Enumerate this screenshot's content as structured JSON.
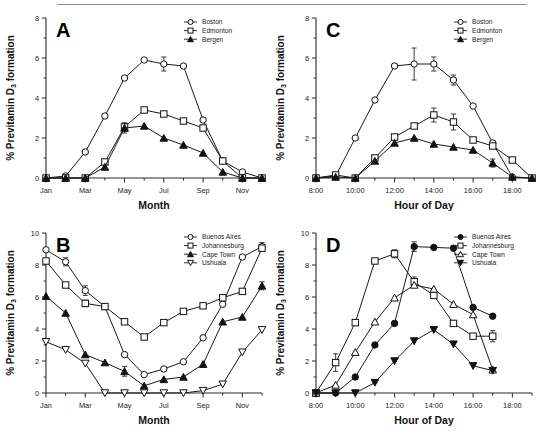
{
  "figure": {
    "ylabel_main": "% Previtamin D",
    "ylabel_subscript": "3",
    "ylabel_tail": " formation",
    "month_axis_title": "Month",
    "hour_axis_title": "Hour of Day"
  },
  "panels": {
    "a": {
      "letter": "A",
      "xlabel": "Month",
      "ylabel": "% Previtamin D3 formation",
      "legend": [
        {
          "label": "Boston",
          "marker": "open-circle"
        },
        {
          "label": "Edmonton",
          "marker": "open-square"
        },
        {
          "label": "Bergen",
          "marker": "filled-triangle"
        }
      ],
      "xticks": [
        "Jan",
        "Mar",
        "May",
        "Jul",
        "Sep",
        "Nov"
      ],
      "yticks": [
        "0",
        "2",
        "4",
        "6",
        "8"
      ]
    },
    "b": {
      "letter": "B",
      "xlabel": "Month",
      "ylabel": "% Previtamin D3 formation",
      "legend": [
        {
          "label": "Buenos Aires",
          "marker": "open-circle"
        },
        {
          "label": "Johannesburg",
          "marker": "open-square"
        },
        {
          "label": "Cape Town",
          "marker": "filled-triangle"
        },
        {
          "label": "Ushuaia",
          "marker": "open-inv-triangle"
        }
      ],
      "xticks": [
        "Jan",
        "Mar",
        "May",
        "Jul",
        "Sep",
        "Nov"
      ],
      "yticks": [
        "0",
        "2",
        "4",
        "6",
        "8",
        "10"
      ]
    },
    "c": {
      "letter": "C",
      "xlabel": "Hour of Day",
      "ylabel": "% Previtamin D3 formation",
      "legend": [
        {
          "label": "Boston",
          "marker": "open-circle"
        },
        {
          "label": "Edmonton",
          "marker": "open-square"
        },
        {
          "label": "Bergen",
          "marker": "filled-triangle"
        }
      ],
      "xticks": [
        "8:00",
        "10:00",
        "12:00",
        "14:00",
        "16:00",
        "18:00"
      ],
      "yticks": [
        "0",
        "2",
        "4",
        "6",
        "8"
      ]
    },
    "d": {
      "letter": "D",
      "xlabel": "Hour of Day",
      "ylabel": "% Previtamin D3 formation",
      "legend": [
        {
          "label": "Buenos Aires",
          "marker": "filled-circle"
        },
        {
          "label": "Johannesburg",
          "marker": "open-square"
        },
        {
          "label": "Cape Town",
          "marker": "open-triangle"
        },
        {
          "label": "Ushuaia",
          "marker": "filled-inv-triangle"
        }
      ],
      "xticks": [
        "8:00",
        "10:00",
        "12:00",
        "14:00",
        "16:00",
        "18:00"
      ],
      "yticks": [
        "0",
        "2",
        "4",
        "6",
        "8",
        "10"
      ]
    }
  },
  "chart_data": [
    {
      "type": "line",
      "panel": "A",
      "title": "A",
      "xlabel": "Month",
      "ylabel": "% Previtamin D3 formation",
      "xlim": [
        1,
        12
      ],
      "ylim": [
        0,
        8
      ],
      "grid": false,
      "legend_position": "top-right",
      "x": [
        1,
        2,
        3,
        4,
        5,
        6,
        7,
        8,
        9,
        10,
        11,
        12
      ],
      "xtick_labels": [
        "Jan",
        "Mar",
        "May",
        "Jul",
        "Sep",
        "Nov"
      ],
      "xtick_positions": [
        1,
        3,
        5,
        7,
        9,
        11
      ],
      "series": [
        {
          "name": "Boston",
          "marker": "open-circle",
          "values": [
            0.0,
            0.1,
            1.3,
            3.1,
            5.0,
            5.9,
            5.7,
            5.6,
            2.9,
            0.85,
            0.3,
            0.0
          ],
          "errors": [
            0,
            0,
            0,
            0,
            0,
            0,
            0.35,
            0,
            0,
            0,
            0,
            0
          ]
        },
        {
          "name": "Edmonton",
          "marker": "open-square",
          "values": [
            0.0,
            0.0,
            0.0,
            0.8,
            2.55,
            3.4,
            3.2,
            2.85,
            2.5,
            0.85,
            0.0,
            0.0
          ],
          "errors": [
            0,
            0,
            0,
            0,
            0.2,
            0,
            0,
            0,
            0,
            0,
            0,
            0
          ]
        },
        {
          "name": "Bergen",
          "marker": "filled-triangle",
          "values": [
            0.0,
            0.0,
            0.0,
            0.55,
            2.5,
            2.6,
            2.0,
            1.65,
            1.25,
            0.3,
            0.0,
            0.0
          ],
          "errors": [
            0,
            0,
            0,
            0,
            0.25,
            0,
            0,
            0,
            0,
            0,
            0,
            0
          ]
        }
      ]
    },
    {
      "type": "line",
      "panel": "B",
      "title": "B",
      "xlabel": "Month",
      "ylabel": "% Previtamin D3 formation",
      "xlim": [
        1,
        12
      ],
      "ylim": [
        0,
        10
      ],
      "grid": false,
      "legend_position": "top-right",
      "x": [
        1,
        2,
        3,
        4,
        5,
        6,
        7,
        8,
        9,
        10,
        11,
        12
      ],
      "xtick_labels": [
        "Jan",
        "Mar",
        "May",
        "Jul",
        "Sep",
        "Nov"
      ],
      "xtick_positions": [
        1,
        3,
        5,
        7,
        9,
        11
      ],
      "series": [
        {
          "name": "Buenos Aires",
          "marker": "open-circle",
          "values": [
            8.95,
            8.2,
            6.4,
            5.4,
            2.4,
            1.15,
            1.5,
            1.95,
            3.45,
            5.55,
            8.5,
            9.15
          ],
          "errors": [
            0,
            0.25,
            0.3,
            0,
            0,
            0,
            0,
            0,
            0,
            0,
            0,
            0.25
          ]
        },
        {
          "name": "Johannesburg",
          "marker": "open-square",
          "values": [
            8.25,
            6.75,
            5.6,
            5.4,
            4.45,
            3.5,
            4.4,
            5.1,
            5.45,
            5.95,
            6.35,
            9.05
          ],
          "errors": [
            0,
            0,
            0.2,
            0,
            0,
            0,
            0,
            0,
            0,
            0,
            0,
            0
          ]
        },
        {
          "name": "Cape Town",
          "marker": "filled-triangle",
          "values": [
            6.05,
            5.0,
            2.4,
            1.9,
            1.35,
            0.45,
            0.85,
            1.0,
            1.8,
            4.45,
            4.75,
            6.7
          ],
          "errors": [
            0,
            0,
            0,
            0,
            0.3,
            0,
            0,
            0,
            0,
            0,
            0,
            0.25
          ]
        },
        {
          "name": "Ushuaia",
          "marker": "open-inv-triangle",
          "values": [
            3.2,
            2.7,
            1.85,
            0.0,
            0.0,
            0.0,
            0.0,
            0.0,
            0.15,
            0.55,
            2.55,
            3.95
          ],
          "errors": [
            0,
            0,
            0,
            0,
            0,
            0,
            0,
            0,
            0,
            0,
            0,
            0
          ]
        }
      ]
    },
    {
      "type": "line",
      "panel": "C",
      "title": "C",
      "xlabel": "Hour of Day",
      "ylabel": "% Previtamin D3 formation",
      "xlim": [
        8,
        19
      ],
      "ylim": [
        0,
        8
      ],
      "grid": false,
      "legend_position": "top-right",
      "x": [
        8,
        9,
        10,
        11,
        12,
        13,
        14,
        15,
        16,
        17,
        18,
        19
      ],
      "xtick_labels": [
        "8:00",
        "10:00",
        "12:00",
        "14:00",
        "16:00",
        "18:00"
      ],
      "xtick_positions": [
        8,
        10,
        12,
        14,
        16,
        18
      ],
      "series": [
        {
          "name": "Boston",
          "marker": "open-circle",
          "values": [
            0.0,
            0.1,
            2.0,
            3.9,
            5.6,
            5.7,
            5.7,
            4.9,
            3.6,
            1.75,
            0.05,
            0.0
          ],
          "errors": [
            0,
            0,
            0,
            0,
            0,
            0.8,
            0.35,
            0.25,
            0,
            0,
            0,
            0
          ]
        },
        {
          "name": "Edmonton",
          "marker": "open-square",
          "values": [
            0.0,
            0.15,
            0.0,
            1.0,
            2.05,
            2.6,
            3.15,
            2.8,
            1.9,
            1.6,
            0.9,
            0.0
          ],
          "errors": [
            0,
            0,
            0,
            0,
            0,
            0,
            0.35,
            0.4,
            0,
            0,
            0,
            0
          ]
        },
        {
          "name": "Bergen",
          "marker": "filled-triangle",
          "values": [
            0.0,
            0.05,
            0.0,
            0.85,
            1.75,
            2.0,
            1.7,
            1.55,
            1.4,
            0.75,
            0.05,
            0.0
          ],
          "errors": [
            0,
            0,
            0,
            0,
            0,
            0,
            0,
            0,
            0,
            0.2,
            0,
            0
          ]
        }
      ]
    },
    {
      "type": "line",
      "panel": "D",
      "title": "D",
      "xlabel": "Hour of Day",
      "ylabel": "% Previtamin D3 formation",
      "xlim": [
        8,
        19
      ],
      "ylim": [
        0,
        10
      ],
      "grid": false,
      "legend_position": "top-right",
      "x": [
        8,
        9,
        10,
        11,
        12,
        13,
        14,
        15,
        16,
        17
      ],
      "xtick_labels": [
        "8:00",
        "10:00",
        "12:00",
        "14:00",
        "16:00",
        "18:00"
      ],
      "xtick_positions": [
        8,
        10,
        12,
        14,
        16,
        18
      ],
      "series": [
        {
          "name": "Buenos Aires",
          "marker": "filled-circle",
          "values": [
            0.0,
            0.0,
            1.0,
            3.0,
            4.35,
            9.15,
            9.1,
            9.05,
            5.35,
            4.8
          ],
          "errors": [
            0,
            0,
            0,
            0,
            0,
            0.3,
            0,
            0,
            0,
            0
          ]
        },
        {
          "name": "Johannesburg",
          "marker": "open-square",
          "values": [
            0.0,
            1.9,
            4.4,
            8.25,
            8.7,
            6.95,
            6.1,
            4.35,
            3.55,
            3.55
          ],
          "errors": [
            0,
            0.55,
            0,
            0,
            0.25,
            0.3,
            0,
            0,
            0,
            0.35
          ]
        },
        {
          "name": "Cape Town",
          "marker": "open-triangle",
          "values": [
            0.0,
            0.5,
            2.55,
            4.45,
            5.95,
            6.75,
            6.5,
            5.55,
            4.9,
            1.45
          ],
          "errors": [
            0,
            0,
            0,
            0,
            0,
            0,
            0,
            0,
            0,
            0
          ]
        },
        {
          "name": "Ushuaia",
          "marker": "filled-inv-triangle",
          "values": [
            0.0,
            0.0,
            0.0,
            0.65,
            2.0,
            3.25,
            3.95,
            3.05,
            1.7,
            1.4
          ],
          "errors": [
            0,
            0,
            0,
            0,
            0,
            0,
            0,
            0,
            0,
            0
          ]
        }
      ]
    }
  ]
}
